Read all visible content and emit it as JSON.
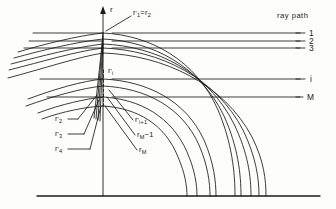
{
  "figure": {
    "title_label": "ray path",
    "axis_label": "r",
    "background": "#fdfdfc",
    "ink_color": "#1a1a1a",
    "axis_x": 103,
    "baseline_y": 196,
    "baseline_x_start": 37,
    "baseline_x_end": 320
  },
  "ray_path_labels": [
    {
      "name": "ray-1",
      "text": "1",
      "x": 309,
      "y": 29
    },
    {
      "name": "ray-2",
      "text": "2",
      "x": 309,
      "y": 38
    },
    {
      "name": "ray-3",
      "text": "3",
      "x": 309,
      "y": 46
    },
    {
      "name": "ray-i",
      "text": "i",
      "x": 309,
      "y": 75
    },
    {
      "name": "ray-M",
      "text": "M",
      "x": 307,
      "y": 93
    }
  ],
  "radius_labels": [
    {
      "name": "r-prime-1-equals-r-2",
      "html": "r<sup class='prime'>&prime;</sup><sub>1</sub>=r<sub>2</sub>",
      "x": 133,
      "y": 10
    },
    {
      "name": "r-prime-i",
      "html": "r<sup class='prime'>&prime;</sup><sub>i</sub>",
      "x": 108,
      "y": 68
    },
    {
      "name": "r-prime-2",
      "html": "r<sup class='prime'>&prime;</sup><sub>2</sub>",
      "x": 56,
      "y": 121
    },
    {
      "name": "r-prime-3",
      "html": "r<sup class='prime'>&prime;</sup><sub>3</sub>",
      "x": 56,
      "y": 136
    },
    {
      "name": "r-prime-4",
      "html": "r<sup class='prime'>&prime;</sup><sub>4</sub>",
      "x": 56,
      "y": 151
    },
    {
      "name": "r-prime-i-plus-1",
      "html": "r<sup class='prime'>&prime;</sup><sub>i+1</sub>",
      "x": 135,
      "y": 123
    },
    {
      "name": "r-M-minus-1",
      "html": "r<sub>M</sub>&minus;1",
      "x": 137,
      "y": 138
    },
    {
      "name": "r-M",
      "html": "r<sub>M</sub>",
      "x": 139,
      "y": 153
    }
  ],
  "chart_data": {
    "type": "line",
    "title": "ray path",
    "xlabel": "",
    "ylabel": "r",
    "incident_ray_lines": [
      {
        "label": "1",
        "y": 33,
        "x_start": 33,
        "x_end": 300
      },
      {
        "label": "2",
        "y": 41,
        "x_start": 29,
        "x_end": 300
      },
      {
        "label": "3",
        "y": 48,
        "x_start": 24,
        "x_end": 300
      },
      {
        "label": "i",
        "y": 79,
        "x_start": 40,
        "x_end": 300
      },
      {
        "label": "M",
        "y": 97,
        "x_start": 47,
        "x_end": 300
      }
    ],
    "turning_radii": {
      "names": [
        "r'1=r2",
        "r'i",
        "r'2",
        "r'3",
        "r'4",
        "r'i+1",
        "rM-1",
        "rM"
      ],
      "apex_y": [
        33,
        79,
        41,
        48,
        56,
        88,
        97,
        106
      ]
    },
    "curve_baseline_intercepts": [
      200,
      209,
      224,
      233,
      244,
      259,
      266,
      273,
      280
    ],
    "grid": false,
    "legend_position": "right"
  }
}
